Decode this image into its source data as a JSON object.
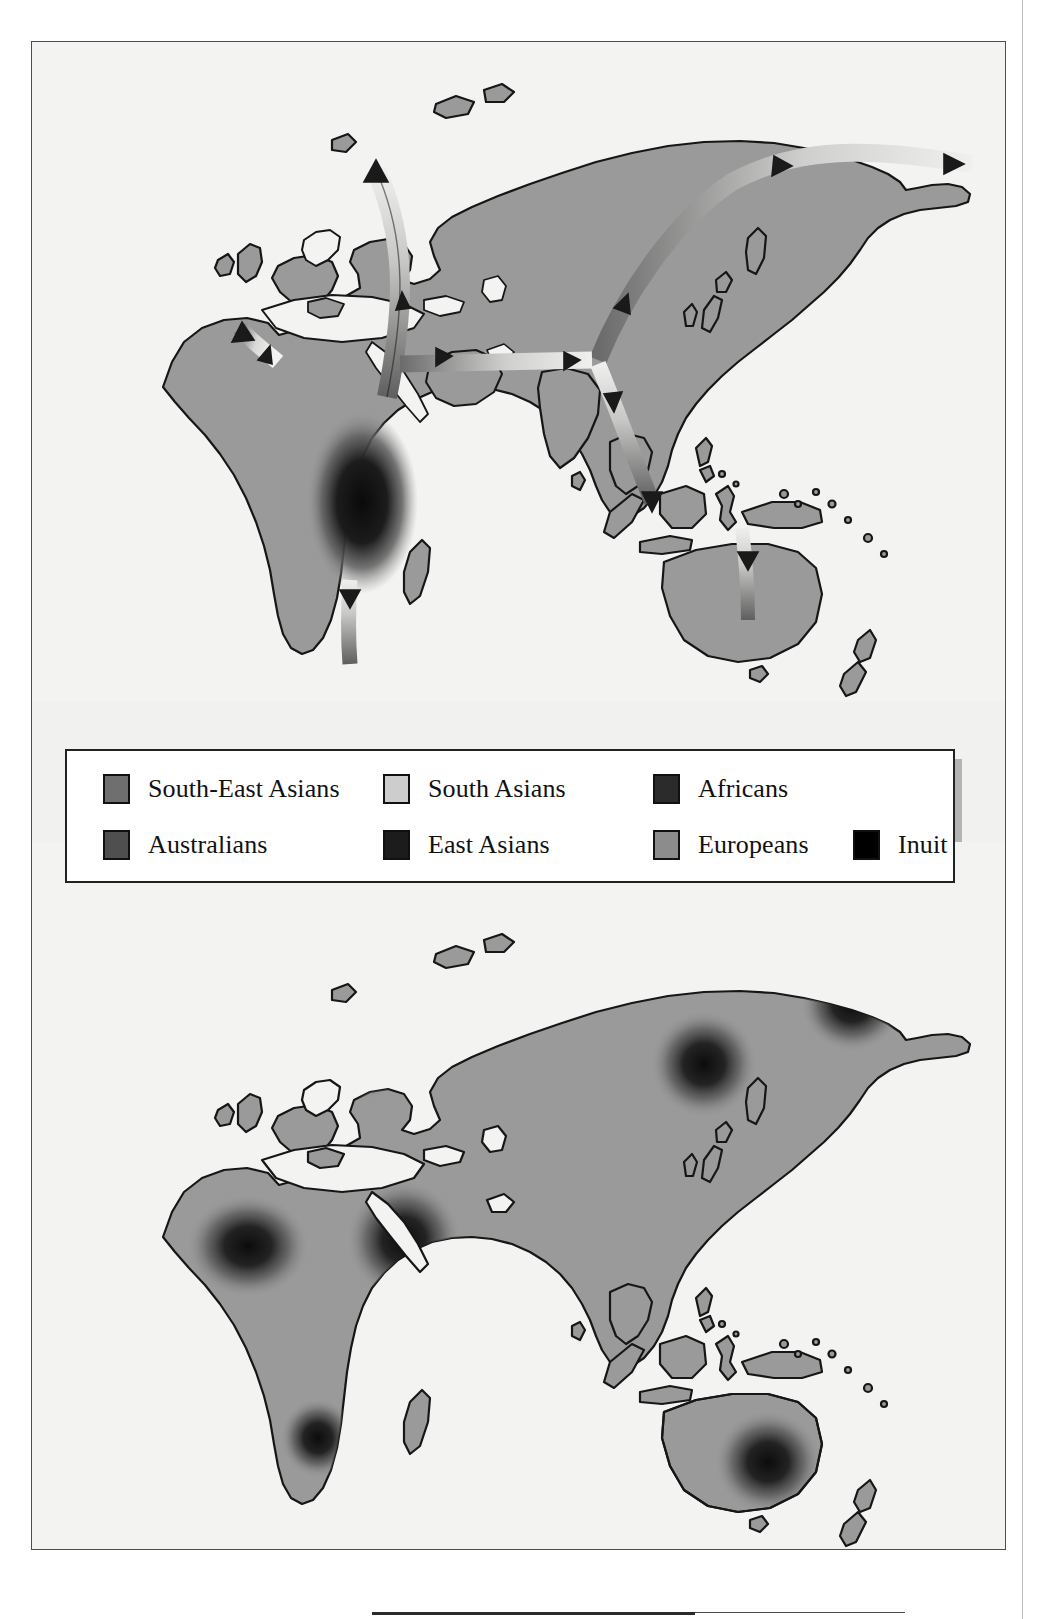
{
  "figure": {
    "type": "two-panel world map",
    "panels": [
      {
        "name": "top-map",
        "description": "World map (Africa, Europe, Asia, Australia) with migration route arrows radiating out of East Africa",
        "land_color": "#9a9a9a",
        "water_color": "#f3f3f1",
        "outline_color": "#1a1a1a",
        "origin_blob": "East Africa",
        "routes": [
          "East Africa to Southern Africa",
          "East Africa to North Africa / Iberia",
          "East Africa to Near East and Europe",
          "Near East across Central Asia to Siberia",
          "Siberia to Beringia / Arctic north-east",
          "Near East across South Asia to South-East Asia",
          "South-East Asia to Australia"
        ]
      },
      {
        "name": "bottom-map",
        "description": "Same world map with dark radial density blobs marking regional population concentrations",
        "land_color": "#9a9a9a",
        "water_color": "#f3f3f1",
        "outline_color": "#1a1a1a",
        "blobs": [
          "North-West Africa",
          "Arabia / Near East",
          "Southern Africa",
          "Eastern Europe",
          "East Asia",
          "North-East Siberia",
          "South-East Australia"
        ]
      }
    ]
  },
  "legend": {
    "rows": [
      [
        {
          "label": "South-East Asians",
          "color": "#6f6f6f",
          "swatch": "swatch-south-east-asians"
        },
        {
          "label": "South Asians",
          "color": "#cdcdcd",
          "swatch": "swatch-south-asians"
        },
        {
          "label": "Africans",
          "color": "#2b2b2b",
          "swatch": "swatch-africans"
        }
      ],
      [
        {
          "label": "Australians",
          "color": "#4f4f4f",
          "swatch": "swatch-australians"
        },
        {
          "label": "East Asians",
          "color": "#1c1c1c",
          "swatch": "swatch-east-asians"
        },
        {
          "label": "Europeans",
          "color": "#8c8c8c",
          "swatch": "swatch-europeans"
        },
        {
          "label": "Inuit",
          "color": "#000000",
          "swatch": "swatch-inuit"
        }
      ]
    ]
  },
  "colors": {
    "paper": "#f1f1ef",
    "frame_border": "#4e4e4e",
    "legend_border": "#222222",
    "legend_shadow": "#b4b4b4",
    "land": "#9a9a9a",
    "water": "#f3f3f1",
    "arrow_dark": "#6a6a6a",
    "arrow_light": "#e8e8e6"
  }
}
